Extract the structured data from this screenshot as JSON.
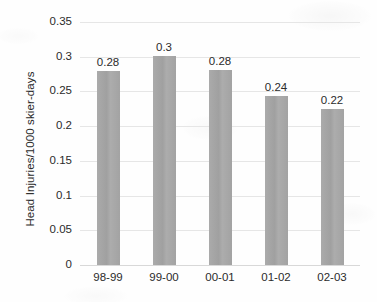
{
  "chart_data": {
    "type": "bar",
    "title": "",
    "subtitle": "",
    "xlabel": "",
    "ylabel": "Head Injuries/1000 skier-days",
    "categories": [
      "98-99",
      "99-00",
      "00-01",
      "01-02",
      "02-03"
    ],
    "values": [
      0.28,
      0.3,
      0.28,
      0.24,
      0.22
    ],
    "data_labels": [
      "0.28",
      "0.3",
      "0.28",
      "0.24",
      "0.22"
    ],
    "series": [
      {
        "name": "Head Injuries/1000 skier-days",
        "values": [
          0.28,
          0.3,
          0.28,
          0.24,
          0.22
        ]
      }
    ],
    "ylim": [
      0,
      0.35
    ],
    "yticks": [
      0,
      0.05,
      0.1,
      0.15,
      0.2,
      0.25,
      0.3,
      0.35
    ],
    "ytick_labels": [
      "0",
      "0.05",
      "0.1",
      "0.15",
      "0.2",
      "0.25",
      "0.3",
      "0.35"
    ],
    "grid": true,
    "grid_axis": "y",
    "legend": false,
    "legend_position": "none",
    "bar_color": "#a6a6a6",
    "gridline_color": "#e6e6e6",
    "text_color": "#2b2b2b",
    "background_color": "#fefefe"
  }
}
